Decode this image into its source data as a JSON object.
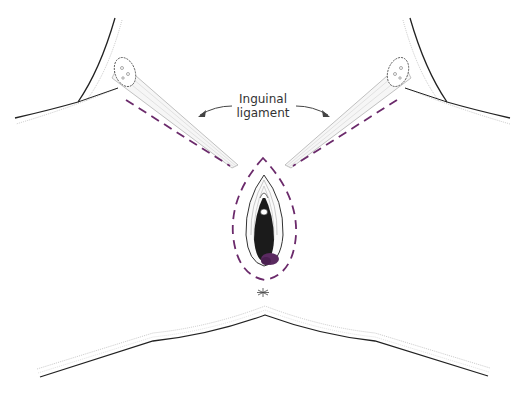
{
  "figure": {
    "type": "anatomical-illustration",
    "labels": {
      "line1": "Inguinal",
      "line2": "ligament"
    },
    "colors": {
      "incision_dashed": "#6b2a6b",
      "outline": "#222222",
      "soft_line": "#aaaaaa",
      "lesion": "#5a2a60",
      "background": "#ffffff"
    }
  }
}
